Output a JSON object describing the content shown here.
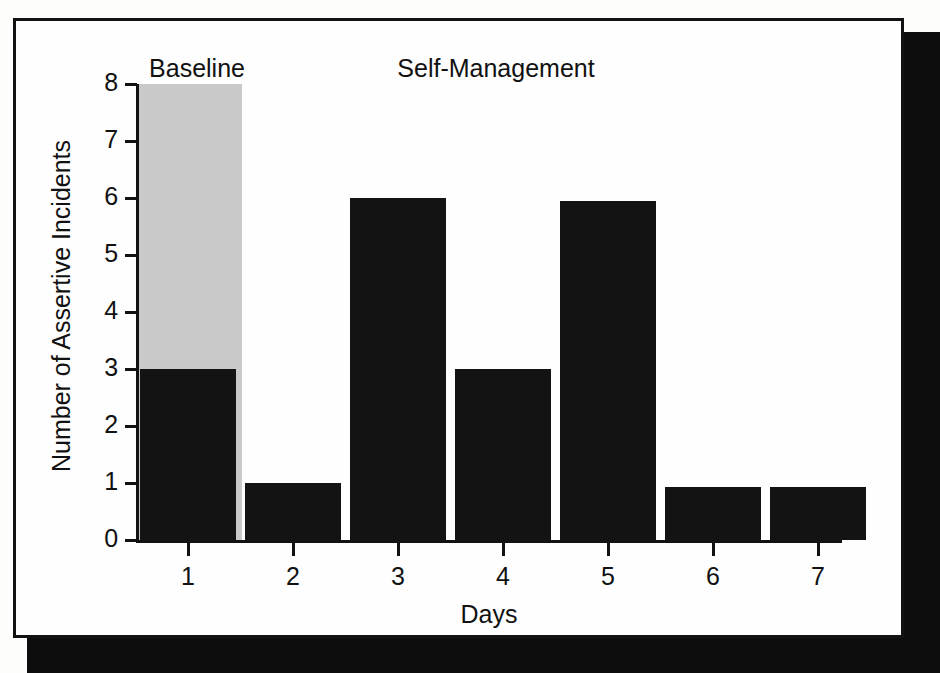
{
  "figure": {
    "frame_color": "#121212",
    "shadow_color": "#0d0d0d",
    "page_background": "#fdfdfc"
  },
  "chart_data": {
    "type": "bar",
    "title": "",
    "subtitle": "",
    "xlabel": "Days",
    "ylabel": "Number of Assertive Incidents",
    "categories": [
      "1",
      "2",
      "3",
      "4",
      "5",
      "6",
      "7"
    ],
    "values": [
      3,
      1,
      6,
      3,
      5.95,
      0.93,
      0.93
    ],
    "series": [
      {
        "name": "Number of Assertive Incidents",
        "values": [
          3,
          1,
          6,
          3,
          5.95,
          0.93,
          0.93
        ],
        "color": "#131313"
      }
    ],
    "xlim": [
      0.5,
      7.5
    ],
    "ylim": [
      0,
      8
    ],
    "ytick_labels": [
      "0",
      "1",
      "2",
      "3",
      "4",
      "5",
      "6",
      "7",
      "8"
    ],
    "ytick_values": [
      0,
      1,
      2,
      3,
      4,
      5,
      6,
      7,
      8
    ],
    "xtick_labels": [
      "1",
      "2",
      "3",
      "4",
      "5",
      "6",
      "7"
    ],
    "grid": false,
    "legend": "none",
    "bar_color": "#131313",
    "annotations": [
      {
        "name": "baseline-phase-label",
        "text": "Baseline",
        "covers_categories": [
          "1"
        ],
        "shading_color": "#c9c9c9"
      },
      {
        "name": "self-management-phase-label",
        "text": "Self-Management",
        "covers_categories": [
          "2",
          "3",
          "4",
          "5",
          "6",
          "7"
        ],
        "shading_color": "none"
      }
    ]
  },
  "phases": [
    {
      "label": "Baseline",
      "left": 121,
      "width": 120
    },
    {
      "label": "Self-Management",
      "left": 300,
      "width": 360
    }
  ]
}
